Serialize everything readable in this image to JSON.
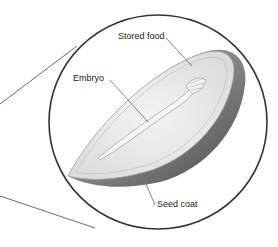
{
  "diagram": {
    "labels": {
      "stored_food": "Stored food",
      "embryo": "Embryo",
      "seed_coat": "Seed coat"
    },
    "colors": {
      "outline": "#333333",
      "seed_fill": "#e8e8e8",
      "seed_coat": "#8a8a8a",
      "background": "#ffffff"
    }
  }
}
